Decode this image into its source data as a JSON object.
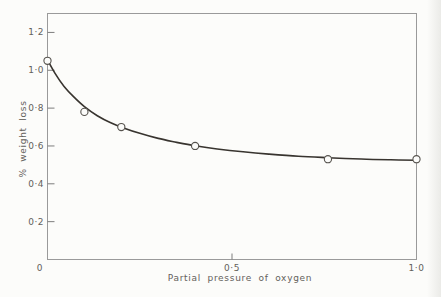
{
  "chart_data": {
    "type": "scatter",
    "title": "",
    "xlabel": "Partial pressure of oxygen",
    "ylabel": "% weight loss",
    "xlim": [
      0,
      1.0
    ],
    "ylim": [
      0,
      1.3
    ],
    "grid": false,
    "legend": "none",
    "frame": "full-box",
    "tick_style": "inward",
    "x_ticks": [
      {
        "value": 0,
        "label": "0",
        "tick_mark": false
      },
      {
        "value": 0.5,
        "label": "0·5",
        "tick_mark": true
      },
      {
        "value": 1.0,
        "label": "1·0",
        "tick_mark": false
      }
    ],
    "y_ticks": [
      {
        "value": 0.2,
        "label": "0·2"
      },
      {
        "value": 0.4,
        "label": "0·4"
      },
      {
        "value": 0.6,
        "label": "0·6"
      },
      {
        "value": 0.8,
        "label": "0·8"
      },
      {
        "value": 1.0,
        "label": "1·0"
      },
      {
        "value": 1.2,
        "label": "1·2"
      }
    ],
    "series": [
      {
        "name": "weight-loss-vs-oxygen-pressure",
        "marker": "open-circle",
        "points": [
          [
            0,
            1.05
          ],
          [
            0.1,
            0.78
          ],
          [
            0.2,
            0.7
          ],
          [
            0.4,
            0.6
          ],
          [
            0.76,
            0.53
          ],
          [
            1.0,
            0.53
          ]
        ]
      }
    ],
    "fitted_curve": [
      [
        0,
        1.055
      ],
      [
        0.02,
        0.985
      ],
      [
        0.045,
        0.915
      ],
      [
        0.07,
        0.862
      ],
      [
        0.1,
        0.808
      ],
      [
        0.135,
        0.76
      ],
      [
        0.17,
        0.724
      ],
      [
        0.21,
        0.693
      ],
      [
        0.25,
        0.667
      ],
      [
        0.3,
        0.64
      ],
      [
        0.35,
        0.619
      ],
      [
        0.4,
        0.601
      ],
      [
        0.46,
        0.584
      ],
      [
        0.53,
        0.569
      ],
      [
        0.6,
        0.557
      ],
      [
        0.68,
        0.546
      ],
      [
        0.76,
        0.538
      ],
      [
        0.85,
        0.531
      ],
      [
        0.93,
        0.527
      ],
      [
        1.0,
        0.525
      ]
    ],
    "colors": {
      "background": "#fcfcfa",
      "frame": "#9a9a9a",
      "tick": "#7d7d7d",
      "text": "#63605b",
      "curve": "#38342f",
      "point_stroke": "#55524d",
      "point_fill": "#fcfcfa"
    }
  }
}
